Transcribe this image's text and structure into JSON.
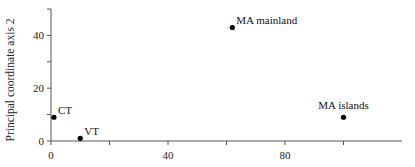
{
  "chart_data": {
    "type": "scatter",
    "title": "",
    "xlabel": "",
    "ylabel": "Principal coordinate axis 2",
    "xlim": [
      0,
      120
    ],
    "ylim": [
      0,
      50
    ],
    "x_ticks": [
      0,
      20,
      40,
      60,
      80,
      100
    ],
    "x_tick_labels": [
      "0",
      "",
      "40",
      "",
      "80",
      ""
    ],
    "y_ticks": [
      0,
      10,
      20,
      30,
      40,
      50
    ],
    "y_tick_labels": [
      "0",
      "",
      "20",
      "",
      "40",
      ""
    ],
    "grid": false,
    "legend": null,
    "points": [
      {
        "label": "MA mainland",
        "x": 62,
        "y": 43
      },
      {
        "label": "MA islands",
        "x": 100,
        "y": 9
      },
      {
        "label": "CT",
        "x": 1,
        "y": 9
      },
      {
        "label": "VT",
        "x": 10,
        "y": 1
      }
    ]
  }
}
